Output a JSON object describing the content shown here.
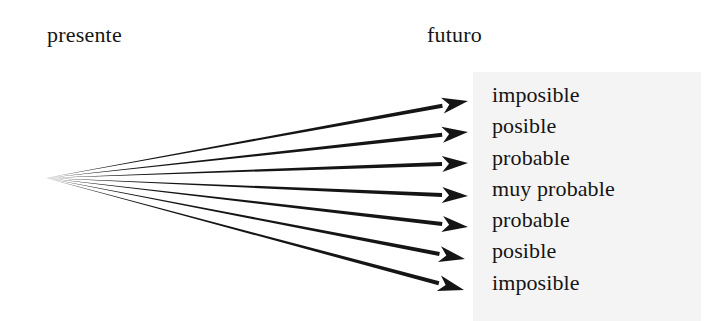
{
  "diagram": {
    "background_color": "#ffffff",
    "panel_color": "#f4f4f4",
    "ink_color": "#151515",
    "headings": {
      "left_label": "presente",
      "right_label": "futuro"
    },
    "origin": {
      "label": "presente",
      "x": 46,
      "y": 178
    },
    "outcomes": [
      {
        "label": "imposible",
        "tip_x": 468,
        "tip_y": 101
      },
      {
        "label": "posible",
        "tip_x": 468,
        "tip_y": 132
      },
      {
        "label": "probable",
        "tip_x": 468,
        "tip_y": 163
      },
      {
        "label": "muy probable",
        "tip_x": 468,
        "tip_y": 196
      },
      {
        "label": "probable",
        "tip_x": 468,
        "tip_y": 227
      },
      {
        "label": "posible",
        "tip_x": 465,
        "tip_y": 259
      },
      {
        "label": "imposible",
        "tip_x": 464,
        "tip_y": 290
      }
    ]
  }
}
